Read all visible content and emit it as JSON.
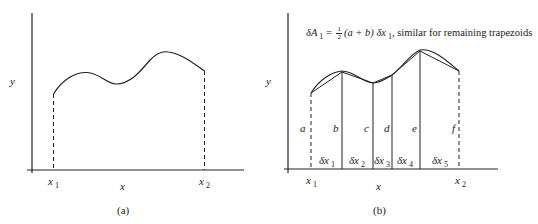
{
  "panel_a": {
    "caption": "(a)",
    "y_label": "y",
    "x_label": "x",
    "x1_label": "x",
    "x1_sub": "1",
    "x2_label": "x",
    "x2_sub": "2"
  },
  "panel_b": {
    "caption": "(b)",
    "y_label": "y",
    "x_label": "x",
    "x1_label": "x",
    "x1_sub": "1",
    "x2_label": "x",
    "x2_sub": "2",
    "formula": {
      "lhs": "δA",
      "lhs_sub": "1",
      "eq": "=",
      "frac_num": "1",
      "frac_den": "2",
      "expr": "(a + b) δx",
      "expr_sub": "1",
      "tail": ", similar for remaining trapezoids"
    },
    "heights": [
      "a",
      "b",
      "c",
      "d",
      "e",
      "f"
    ],
    "widths": [
      {
        "label": "δx",
        "sub": "1"
      },
      {
        "label": "δx",
        "sub": "2"
      },
      {
        "label": "δx",
        "sub": "3"
      },
      {
        "label": "δx",
        "sub": "4"
      },
      {
        "label": "δx",
        "sub": "5"
      }
    ]
  },
  "colors": {
    "line": "#222222",
    "background": "#ffffff"
  }
}
